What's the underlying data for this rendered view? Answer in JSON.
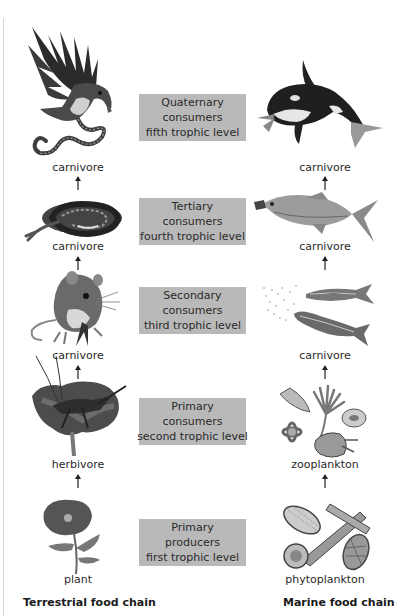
{
  "diagram": {
    "type": "food-chain-comparison",
    "levels": [
      {
        "box": [
          "Quaternary",
          "consumers",
          "fifth trophic level"
        ],
        "terrestrial": {
          "organism": "eagle-with-snake",
          "label": "carnivore"
        },
        "marine": {
          "organism": "orca",
          "label": "carnivore"
        }
      },
      {
        "box": [
          "Tertiary",
          "consumers",
          "fourth trophic level"
        ],
        "terrestrial": {
          "organism": "snake",
          "label": "carnivore"
        },
        "marine": {
          "organism": "large-fish",
          "label": "carnivore"
        }
      },
      {
        "box": [
          "Secondary",
          "consumers",
          "third trophic level"
        ],
        "terrestrial": {
          "organism": "mouse",
          "label": "carnivore"
        },
        "marine": {
          "organism": "small-fish",
          "label": "carnivore"
        }
      },
      {
        "box": [
          "Primary",
          "consumers",
          "second trophic level"
        ],
        "terrestrial": {
          "organism": "grasshopper-on-flower",
          "label": "herbivore"
        },
        "marine": {
          "organism": "zooplankton-cluster",
          "label": "zooplankton"
        }
      },
      {
        "box": [
          "Primary",
          "producers",
          "first trophic level"
        ],
        "terrestrial": {
          "organism": "poppy-plant",
          "label": "plant"
        },
        "marine": {
          "organism": "diatoms",
          "label": "phytoplankton"
        }
      }
    ],
    "columns": {
      "left_title": "Terrestrial food chain",
      "right_title": "Marine food chain"
    },
    "colors": {
      "box_fill": "#b9b9b9",
      "text": "#2a2a2a",
      "illustration": "grayscale"
    }
  }
}
